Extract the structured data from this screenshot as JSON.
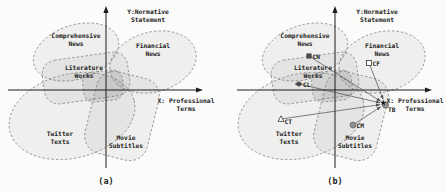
{
  "figure": {
    "title_hidden": "",
    "colors": {
      "axis": "#1c1c1c",
      "region_stroke": "#8a8a8a",
      "region_fill": "rgba(90,90,90,0.07)",
      "overlap_fill": "rgba(90,90,90,0.12)",
      "arrow": "#4a4a4a",
      "marker_dark": "#4a4a4a",
      "marker_gray": "#8f8f8f",
      "marker_open_fill": "#ffffff",
      "marker_stroke": "#333333"
    },
    "axes": {
      "y_label_lines": [
        "Y:Normative",
        "Statement"
      ],
      "x_label_lines": [
        "X: Professional",
        "Terms"
      ],
      "y_x": 106,
      "y_top": 6,
      "y_bottom": 168,
      "x_y": 90,
      "x_left": 8,
      "x_right": 203,
      "y_label_x": 148,
      "y_label_y": 14,
      "x_label_x": 186,
      "x_label_y": 103
    },
    "regions": [
      {
        "id": "comprehensive-news",
        "type": "ellipse",
        "cx": 76,
        "cy": 52,
        "rx": 44,
        "ry": 27,
        "rot": -18,
        "label_lines": [
          "Comprehensive",
          "News"
        ],
        "lx": 76,
        "ly": 38
      },
      {
        "id": "financial-news",
        "type": "ellipse",
        "cx": 153,
        "cy": 62,
        "rx": 44,
        "ry": 30,
        "rot": -15,
        "label_lines": [
          "Financial",
          "News"
        ],
        "lx": 153,
        "ly": 48
      },
      {
        "id": "literature-works",
        "type": "rect",
        "cx": 86,
        "cy": 78,
        "w": 86,
        "h": 44,
        "r": 14,
        "rot": -8,
        "label_lines": [
          "Literature",
          "Works"
        ],
        "lx": 84,
        "ly": 70
      },
      {
        "id": "twitter-texts",
        "type": "ellipse",
        "cx": 72,
        "cy": 116,
        "rx": 64,
        "ry": 42,
        "rot": -14,
        "label_lines": [
          "Twitter",
          "Texts"
        ],
        "lx": 60,
        "ly": 136
      },
      {
        "id": "movie-subtitles",
        "type": "rect",
        "cx": 122,
        "cy": 116,
        "w": 64,
        "h": 84,
        "r": 18,
        "rot": 14,
        "label_lines": [
          "Movie",
          "Subtitles"
        ],
        "lx": 126,
        "ly": 140
      },
      {
        "id": "center-overlap",
        "type": "rect",
        "cx": 103,
        "cy": 86,
        "w": 40,
        "h": 30,
        "r": 10,
        "rot": -6,
        "label_lines": [],
        "lx": 0,
        "ly": 0,
        "overlap": true
      }
    ],
    "markers": [
      {
        "id": "CN",
        "shape": "filled-square",
        "x": 80,
        "y": 56,
        "label": "CN",
        "ldx": 3.5,
        "ldy": 2.5
      },
      {
        "id": "CF",
        "shape": "open-square",
        "x": 140,
        "y": 63,
        "label": "CF",
        "ldx": 3.5,
        "ldy": 2.5
      },
      {
        "id": "CL",
        "shape": "filled-diamond",
        "x": 70,
        "y": 84,
        "label": "CL",
        "ldx": 4,
        "ldy": 2.5
      },
      {
        "id": "CT",
        "shape": "open-triangle",
        "x": 52,
        "y": 119,
        "label": "CT",
        "ldx": 3.5,
        "ldy": 4.5
      },
      {
        "id": "CM",
        "shape": "filled-circle",
        "x": 124,
        "y": 125,
        "label": "CM",
        "ldx": 3.5,
        "ldy": 2.5
      },
      {
        "id": "TB",
        "shape": "star-circle",
        "x": 156,
        "y": 104,
        "label": "TB",
        "ldx": 3,
        "ldy": 7.5
      }
    ],
    "arrow_sources": [
      "CN",
      "CF",
      "CL",
      "CT",
      "CM"
    ],
    "arrow_target": "TB",
    "subplots": [
      {
        "id": "a",
        "caption": "(a)",
        "dx": 0,
        "has_markers": false
      },
      {
        "id": "b",
        "caption": "(b)",
        "dx": 229,
        "has_markers": true
      }
    ],
    "caption_x": 106,
    "caption_y": 184
  }
}
